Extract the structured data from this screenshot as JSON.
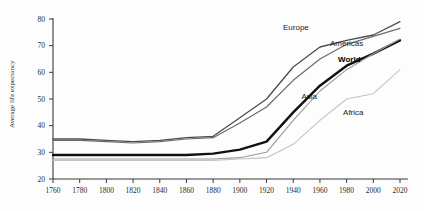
{
  "chart_data": {
    "type": "line",
    "title": "",
    "xlabel": "",
    "ylabel": "Average life expectancy",
    "xlim": [
      1760,
      2020
    ],
    "ylim": [
      20,
      80
    ],
    "grid": false,
    "legend_position": "inline-labels",
    "xticks": [
      "1760",
      "1780",
      "1800",
      "1820",
      "1840",
      "1860",
      "1880",
      "1900",
      "1920",
      "1940",
      "1960",
      "1980",
      "2000",
      "2020"
    ],
    "yticks": [
      "20",
      "30",
      "40",
      "50",
      "60",
      "70",
      "80"
    ],
    "x": [
      1760,
      1780,
      1800,
      1820,
      1840,
      1860,
      1880,
      1900,
      1920,
      1940,
      1960,
      1980,
      2000,
      2020
    ],
    "series": [
      {
        "name": "Europe",
        "label": "Europe",
        "color": "#4d4d4d",
        "width": 1.3,
        "bold": false,
        "values": [
          35,
          35,
          34.5,
          34,
          34.5,
          35.5,
          36,
          43,
          50,
          62,
          69.5,
          72,
          74,
          79
        ]
      },
      {
        "name": "Americas",
        "label": "Americas",
        "color": "#6b6b6b",
        "width": 1.2,
        "bold": false,
        "values": [
          34.5,
          34.5,
          34,
          33.5,
          34,
          35,
          35.5,
          41,
          47,
          57,
          65,
          70.5,
          73.5,
          76.5
        ]
      },
      {
        "name": "World",
        "label": "World",
        "color": "#111111",
        "width": 2.4,
        "bold": true,
        "values": [
          29,
          29,
          29,
          29,
          29,
          29,
          29.5,
          31,
          34,
          45,
          55,
          62.5,
          67,
          72
        ]
      },
      {
        "name": "Asia",
        "label": "Asia",
        "color": "#9a9a9a",
        "width": 1.1,
        "bold": false,
        "values": [
          27.5,
          27.5,
          27.5,
          27.5,
          27.5,
          27.5,
          27.5,
          28,
          30,
          42,
          53,
          61,
          67,
          72.5
        ]
      },
      {
        "name": "Africa",
        "label": "Africa",
        "color": "#c4c4c4",
        "width": 1.1,
        "bold": false,
        "values": [
          27,
          27,
          27,
          27,
          27,
          27,
          27,
          27.5,
          28,
          33,
          42,
          50,
          52,
          61
        ]
      }
    ],
    "annotations": [
      {
        "text": "Europe",
        "x": 1942,
        "y": 76
      },
      {
        "text": "Americas",
        "x": 1980,
        "y": 70
      },
      {
        "text": "World",
        "x": 1982,
        "y": 64
      },
      {
        "text": "Asia",
        "x": 1952,
        "y": 50
      },
      {
        "text": "Africa",
        "x": 1985,
        "y": 44
      }
    ]
  }
}
